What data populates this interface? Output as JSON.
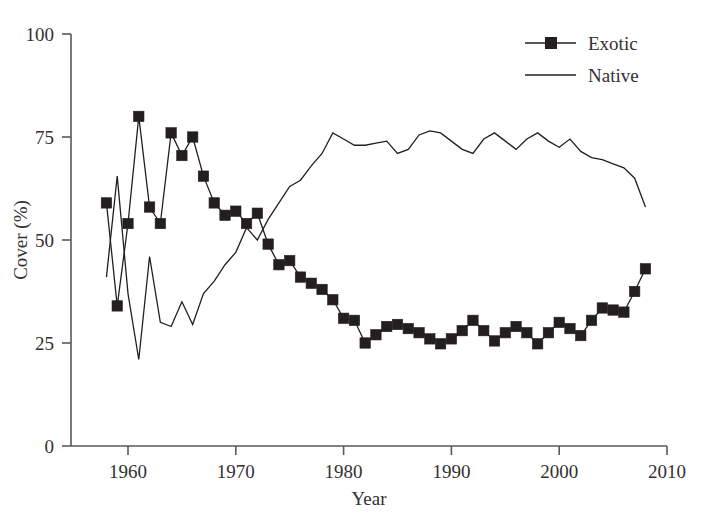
{
  "chart_data": {
    "type": "line",
    "title": "",
    "xlabel": "Year",
    "ylabel": "Cover (%)",
    "xlim": [
      1958,
      2010
    ],
    "ylim": [
      0,
      100
    ],
    "xticks": [
      1960,
      1970,
      1980,
      1990,
      2000,
      2010
    ],
    "xtick_labels": [
      "1960",
      "1970",
      "1980",
      "1990",
      "2000",
      "2010"
    ],
    "yticks": [
      0,
      25,
      50,
      75,
      100
    ],
    "ytick_labels": [
      "0",
      "25",
      "50",
      "75",
      "100"
    ],
    "grid": false,
    "legend_position": "top-right",
    "legend": [
      "Exotic",
      "Native"
    ],
    "x": [
      1958,
      1959,
      1960,
      1961,
      1962,
      1963,
      1964,
      1965,
      1966,
      1967,
      1968,
      1969,
      1970,
      1971,
      1972,
      1973,
      1974,
      1975,
      1976,
      1977,
      1978,
      1979,
      1980,
      1981,
      1982,
      1983,
      1984,
      1985,
      1986,
      1987,
      1988,
      1989,
      1990,
      1991,
      1992,
      1993,
      1994,
      1995,
      1996,
      1997,
      1998,
      1999,
      2000,
      2001,
      2002,
      2003,
      2004,
      2005,
      2006,
      2007,
      2008
    ],
    "series": [
      {
        "name": "Exotic",
        "marker": "square",
        "values": [
          59,
          34,
          54,
          80,
          58,
          54,
          76,
          70.5,
          75,
          65.5,
          59,
          56,
          57,
          54,
          56.5,
          49,
          44,
          45,
          41,
          39.5,
          38,
          35.5,
          31,
          30.5,
          25,
          27,
          29,
          29.5,
          28.5,
          27.5,
          26,
          24.8,
          26,
          28,
          30.5,
          28,
          25.5,
          27.5,
          29,
          27.5,
          24.8,
          27.5,
          30,
          28.5,
          26.8,
          30.5,
          33.5,
          33,
          32.5,
          37.5,
          43
        ]
      },
      {
        "name": "Native",
        "marker": "none",
        "values": [
          41,
          65.5,
          37,
          21,
          46,
          30,
          29,
          35,
          29.5,
          37,
          40,
          44,
          47,
          53,
          50,
          55,
          59,
          63,
          64.5,
          68,
          71,
          76,
          74.5,
          73,
          73,
          73.5,
          74,
          71,
          72,
          75.5,
          76.5,
          76,
          74,
          72,
          71,
          74.5,
          76,
          74,
          72,
          74.5,
          76,
          74,
          72.5,
          74.5,
          71.5,
          70,
          69.5,
          68.5,
          67.5,
          65,
          58
        ]
      }
    ]
  },
  "axes": {
    "x_title": "Year",
    "y_title": "Cover (%)"
  },
  "legend": {
    "exotic_label": "Exotic",
    "native_label": "Native"
  },
  "colors": {
    "line": "#231f20",
    "axis": "#58595b",
    "text": "#333033",
    "background": "#ffffff"
  }
}
